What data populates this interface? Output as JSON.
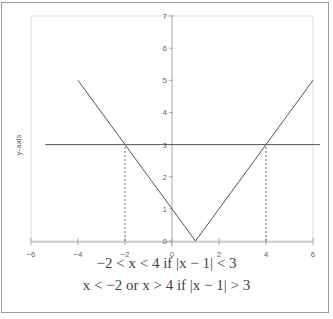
{
  "chart_data": {
    "type": "line",
    "title": "",
    "xlabel": "",
    "ylabel": "y-axis",
    "xlim": [
      -6,
      6
    ],
    "ylim": [
      0,
      7
    ],
    "grid": false,
    "x_ticks": [
      -6,
      -4,
      -2,
      0,
      2,
      4,
      6
    ],
    "x_tick_labels": [
      "−6",
      "−4",
      "−2",
      "0",
      "2",
      "4",
      "6"
    ],
    "y_ticks": [
      0,
      1,
      2,
      3,
      4,
      5,
      6,
      7
    ],
    "y_tick_labels": [
      "0",
      "1",
      "2",
      "3",
      "4",
      "5",
      "6",
      "7"
    ],
    "series": [
      {
        "name": "y = |x − 1|",
        "x": [
          -4,
          1,
          6
        ],
        "y": [
          5,
          0,
          5
        ],
        "color": "#555555",
        "style": "solid"
      },
      {
        "name": "y = 3",
        "x": [
          -5.4,
          6.3
        ],
        "y": [
          3,
          3
        ],
        "color": "#555555",
        "style": "solid"
      },
      {
        "name": "x = -2 marker",
        "x": [
          -2,
          -2
        ],
        "y": [
          0,
          3
        ],
        "color": "#555555",
        "style": "dashed"
      },
      {
        "name": "x = 4 marker",
        "x": [
          4,
          4
        ],
        "y": [
          0,
          3
        ],
        "color": "#555555",
        "style": "dashed"
      }
    ],
    "annotations": [
      "−2 < x < 4 if |x − 1| < 3",
      "x < −2 or x > 4 if |x − 1| > 3"
    ]
  },
  "caption": {
    "line1": "−2 < x < 4 if |x − 1| < 3",
    "line2": "x < −2 or x > 4 if |x − 1| > 3"
  }
}
